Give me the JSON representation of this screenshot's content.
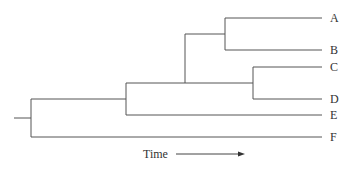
{
  "diagram": {
    "type": "phylogenetic-tree",
    "taxa": [
      "A",
      "B",
      "C",
      "D",
      "E",
      "F"
    ],
    "axis_label": "Time",
    "colors": {
      "line": "#555555",
      "text": "#333333"
    }
  }
}
